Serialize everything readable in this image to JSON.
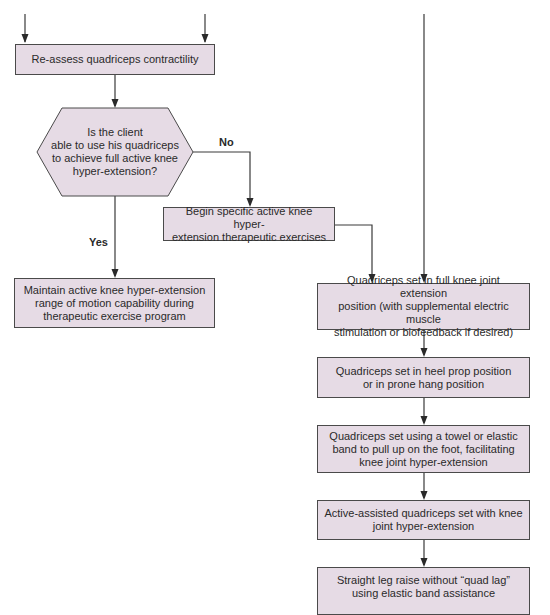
{
  "diagram": {
    "type": "flowchart",
    "colors": {
      "box_fill": "#e6dbe5",
      "stroke": "#4a4a4a",
      "text": "#2a2a2a",
      "background": "#ffffff"
    },
    "nodes": [
      {
        "id": "reassess",
        "shape": "rectangle",
        "text": "Re-assess quadriceps contractility"
      },
      {
        "id": "decision",
        "shape": "hexagon",
        "text": "Is the client able to use his quadriceps to achieve full active knee hyper-extension?"
      },
      {
        "id": "begin",
        "shape": "rectangle",
        "text": "Begin specific active knee hyper-extension therapeutic exercises"
      },
      {
        "id": "maintain",
        "shape": "rectangle",
        "text": "Maintain active knee hyper-extension range of motion capability during therapeutic exercise program"
      },
      {
        "id": "qs_full",
        "shape": "rectangle",
        "text": "Quadriceps set in full knee joint extension position (with supplemental electric muscle stimulation or biofeedback if desired)"
      },
      {
        "id": "qs_heel",
        "shape": "rectangle",
        "text": "Quadriceps set in heel prop position or in prone hang position"
      },
      {
        "id": "qs_towel",
        "shape": "rectangle",
        "text": "Quadriceps set using a towel or elastic band to pull up on the foot, facilitating knee joint hyper-extension"
      },
      {
        "id": "aa_qs",
        "shape": "rectangle",
        "text": "Active-assisted quadriceps set with knee joint hyper-extension"
      },
      {
        "id": "slr",
        "shape": "rectangle",
        "text": "Straight leg raise without “quad lag” using elastic band assistance"
      }
    ],
    "edges": [
      {
        "from": "(above, left)",
        "to": "reassess"
      },
      {
        "from": "(above, right)",
        "to": "reassess"
      },
      {
        "from": "reassess",
        "to": "decision"
      },
      {
        "from": "decision",
        "to": "begin",
        "label": "No"
      },
      {
        "from": "decision",
        "to": "maintain",
        "label": "Yes"
      },
      {
        "from": "begin",
        "to": "qs_full"
      },
      {
        "from": "(above)",
        "to": "qs_full"
      },
      {
        "from": "qs_full",
        "to": "qs_heel"
      },
      {
        "from": "qs_heel",
        "to": "qs_towel"
      },
      {
        "from": "qs_towel",
        "to": "aa_qs"
      },
      {
        "from": "aa_qs",
        "to": "slr"
      }
    ],
    "labels": {
      "no": "No",
      "yes": "Yes"
    },
    "lines": {
      "reassess": [
        "Re-assess quadriceps contractility"
      ],
      "decision": [
        "Is the client",
        "able to use his quadriceps",
        "to achieve full active knee",
        "hyper-extension?"
      ],
      "begin": [
        "Begin specific active knee hyper-",
        "extension therapeutic exercises"
      ],
      "maintain": [
        "Maintain active knee hyper-extension",
        "range of motion capability during",
        "therapeutic exercise program"
      ],
      "qs_full": [
        "Quadriceps set in full knee joint extension",
        "position (with supplemental electric muscle",
        "stimulation or biofeedback if desired)"
      ],
      "qs_heel": [
        "Quadriceps set in heel prop position",
        "or in prone hang position"
      ],
      "qs_towel": [
        "Quadriceps set using a towel or elastic",
        "band to pull up on the foot, facilitating",
        "knee joint hyper-extension"
      ],
      "aa_qs": [
        "Active-assisted quadriceps set with knee",
        "joint hyper-extension"
      ],
      "slr": [
        "Straight leg raise without “quad lag”",
        "using elastic band assistance"
      ]
    }
  }
}
